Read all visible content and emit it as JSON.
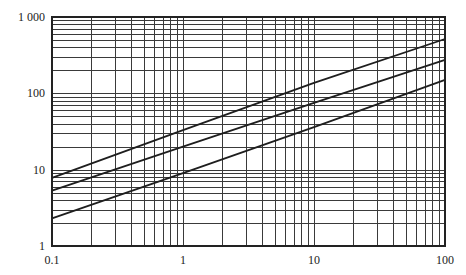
{
  "chart_data": {
    "type": "line",
    "title": "",
    "xlabel": "",
    "ylabel": "",
    "xscale": "log",
    "yscale": "log",
    "xlim": [
      0.1,
      100
    ],
    "ylim": [
      1,
      1000
    ],
    "grid": true,
    "grid_style": "log minor grid (2-9 per decade) on both axes",
    "legend": null,
    "x_tick_labels": [
      {
        "value": 0.1,
        "label": "0.1"
      },
      {
        "value": 1,
        "label": "1"
      },
      {
        "value": 10,
        "label": "10"
      },
      {
        "value": 100,
        "label": "100"
      }
    ],
    "y_tick_labels": [
      {
        "value": 1,
        "label": "1"
      },
      {
        "value": 10,
        "label": "10"
      },
      {
        "value": 100,
        "label": "100"
      },
      {
        "value": 1000,
        "label": "1 000"
      }
    ],
    "x": [
      0.1,
      1,
      10,
      100
    ],
    "series": [
      {
        "name": "upper line",
        "values": [
          7.8,
          33,
          137,
          515
        ]
      },
      {
        "name": "middle line",
        "values": [
          5.3,
          20,
          75,
          275
        ]
      },
      {
        "name": "lower line",
        "values": [
          2.3,
          9,
          36,
          150
        ]
      }
    ]
  },
  "layout": {
    "plot": {
      "left": 52,
      "right": 445,
      "top": 17,
      "bottom": 246
    },
    "colors": {
      "grid": "#3a3a3a",
      "line": "#1e1e1e",
      "frame": "#222222",
      "background": "#ffffff"
    }
  }
}
